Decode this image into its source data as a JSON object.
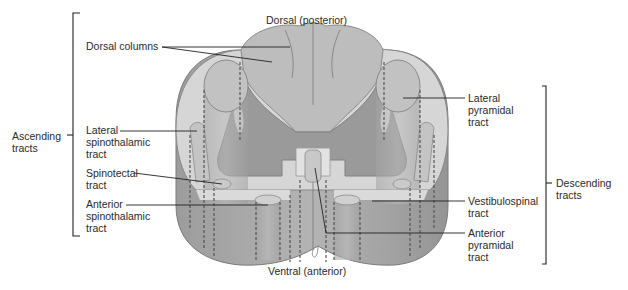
{
  "diagram": {
    "orientation": {
      "top": "Dorsal (posterior)",
      "bottom": "Ventral (anterior)"
    },
    "groups": {
      "ascending": "Ascending\ntracts",
      "descending": "Descending\ntracts"
    },
    "ascending_tracts": [
      {
        "label": "Dorsal columns"
      },
      {
        "label": "Lateral\nspinothalamic\ntract"
      },
      {
        "label": "Spinotectal\ntract"
      },
      {
        "label": "Anterior\nspinothalamic\ntract"
      }
    ],
    "descending_tracts": [
      {
        "label": "Lateral\npyramidal\ntract"
      },
      {
        "label": "Vestibulospinal\ntract"
      },
      {
        "label": "Anterior\npyramidal\ntract"
      }
    ],
    "colors": {
      "white_matter": "#cfcfcf",
      "white_matter_light": "#dedede",
      "gray_matter": "#9a9a9a",
      "tract_fill": "#bdbdbd",
      "column_side": "#a8a8a8",
      "outline": "#7a7a7a",
      "leader_line": "#222222"
    }
  }
}
